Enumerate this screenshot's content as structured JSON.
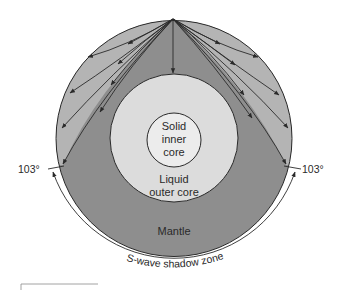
{
  "figure": {
    "labels": {
      "inner_core": [
        "Solid",
        "inner",
        "core"
      ],
      "outer_core": [
        "Liquid",
        "outer core"
      ],
      "mantle": "Mantle",
      "left_angle": "103°",
      "right_angle": "103°",
      "shadow_zone": "S-wave shadow zone",
      "outer_core_mark": "1"
    },
    "colors": {
      "mantle_dark": "#8e8e8e",
      "ray_zone": "#b4b4b4",
      "outer_core": "#dcdcdc",
      "inner_core": "#ececec",
      "line": "#2a2a2a",
      "background": "#ffffff"
    },
    "geometry": {
      "earth": {
        "cx": 174,
        "cy": 138.5,
        "r": 118
      },
      "outer_core": {
        "cx": 174,
        "cy": 138,
        "r": 64
      },
      "inner_core": {
        "cx": 174,
        "cy": 140,
        "r": 27
      },
      "source": {
        "x": 173,
        "y": 19
      },
      "rays_left_end": [
        [
          88,
          57
        ],
        [
          70,
          93
        ],
        [
          62,
          128
        ],
        [
          63,
          164
        ]
      ],
      "rays_right_end": [
        [
          258,
          57
        ],
        [
          279,
          95
        ],
        [
          288,
          128
        ],
        [
          286,
          164
        ]
      ],
      "vertical_ray_end": [
        173,
        73
      ],
      "shadow_angle_deg": 103
    }
  }
}
